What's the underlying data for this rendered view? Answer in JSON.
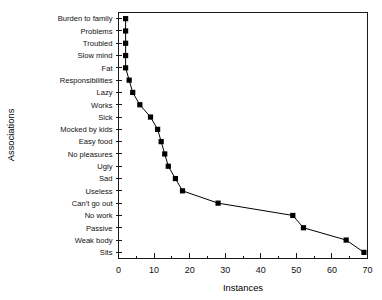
{
  "chart_data": {
    "type": "line",
    "title": "",
    "xlabel": "Instances",
    "ylabel": "Associations",
    "orientation": "horizontal",
    "xlim": [
      0,
      70
    ],
    "ylim_categories_top_to_bottom": true,
    "grid": false,
    "legend": null,
    "marker": "filled-square",
    "line_color": "#000000",
    "marker_color": "#000000",
    "xticks": [
      0,
      10,
      20,
      30,
      40,
      50,
      60,
      70
    ],
    "xtick_labels": [
      "0",
      "10",
      "20",
      "30",
      "40",
      "50",
      "60",
      "70"
    ],
    "xminor_tick_step": 5,
    "categories": [
      "Burden to family",
      "Problems",
      "Troubled",
      "Slow mind",
      "Fat",
      "Responsibilities",
      "Lazy",
      "Works",
      "Sick",
      "Mocked by kids",
      "Easy food",
      "No pleasures",
      "Ugly",
      "Sad",
      "Useless",
      "Can't go out",
      "No work",
      "Passive",
      "Weak body",
      "Sits"
    ],
    "values": [
      2,
      2,
      2,
      2,
      2,
      3,
      4,
      6,
      9,
      11,
      12,
      13,
      14,
      16,
      18,
      28,
      49,
      52,
      64,
      69
    ],
    "points": [
      {
        "label": "Burden to family",
        "value": 2
      },
      {
        "label": "Problems",
        "value": 2
      },
      {
        "label": "Troubled",
        "value": 2
      },
      {
        "label": "Slow mind",
        "value": 2
      },
      {
        "label": "Fat",
        "value": 2
      },
      {
        "label": "Responsibilities",
        "value": 3
      },
      {
        "label": "Lazy",
        "value": 4
      },
      {
        "label": "Works",
        "value": 6
      },
      {
        "label": "Sick",
        "value": 9
      },
      {
        "label": "Mocked by kids",
        "value": 11
      },
      {
        "label": "Easy food",
        "value": 12
      },
      {
        "label": "No pleasures",
        "value": 13
      },
      {
        "label": "Ugly",
        "value": 14
      },
      {
        "label": "Sad",
        "value": 16
      },
      {
        "label": "Useless",
        "value": 18
      },
      {
        "label": "Can't go out",
        "value": 28
      },
      {
        "label": "No work",
        "value": 49
      },
      {
        "label": "Passive",
        "value": 52
      },
      {
        "label": "Weak body",
        "value": 64
      },
      {
        "label": "Sits",
        "value": 69
      }
    ]
  }
}
